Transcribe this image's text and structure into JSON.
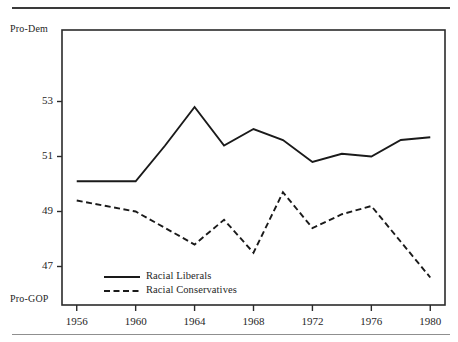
{
  "figure": {
    "has_top_rule": true,
    "has_bottom_rule": true,
    "frame_color": "#2b2b2b",
    "background": "#ffffff"
  },
  "axis_endpoints": {
    "top_label": "Pro-Dem",
    "bottom_label": "Pro-GOP"
  },
  "legend": {
    "entries": [
      {
        "label": "Racial Liberals",
        "style": "solid"
      },
      {
        "label": "Racial Conservatives",
        "style": "dashed"
      }
    ]
  },
  "chart_data": {
    "type": "line",
    "title": "",
    "subtitle": "",
    "xlabel": "",
    "ylabel": "",
    "xlim": [
      1955,
      1981
    ],
    "ylim": [
      45.6,
      55.6
    ],
    "grid": false,
    "legend_position": "inside-bottom-left",
    "xticks": [
      1956,
      1960,
      1964,
      1968,
      1972,
      1976,
      1980
    ],
    "xticklabels": [
      "1956",
      "1960",
      "1964",
      "1968",
      "1972",
      "1976",
      "1980"
    ],
    "yticks": [
      53,
      51,
      49,
      47
    ],
    "yticklabels": [
      "53",
      "51",
      "49",
      "47"
    ],
    "y_axis_endpoint_high": "Pro-Dem",
    "y_axis_endpoint_low": "Pro-GOP",
    "x": [
      1956,
      1958,
      1960,
      1962,
      1964,
      1966,
      1968,
      1970,
      1972,
      1974,
      1976,
      1978,
      1980
    ],
    "series": [
      {
        "name": "Racial Liberals",
        "style": "solid",
        "color": "#1a1a1a",
        "values": [
          50.1,
          50.1,
          50.1,
          51.4,
          52.8,
          51.4,
          52.0,
          51.6,
          50.8,
          51.1,
          51.0,
          51.6,
          51.7
        ]
      },
      {
        "name": "Racial Conservatives",
        "style": "dashed",
        "color": "#1a1a1a",
        "values": [
          49.4,
          49.2,
          49.0,
          48.4,
          47.8,
          48.7,
          47.5,
          49.7,
          48.4,
          48.9,
          49.2,
          47.9,
          46.6
        ]
      }
    ]
  }
}
